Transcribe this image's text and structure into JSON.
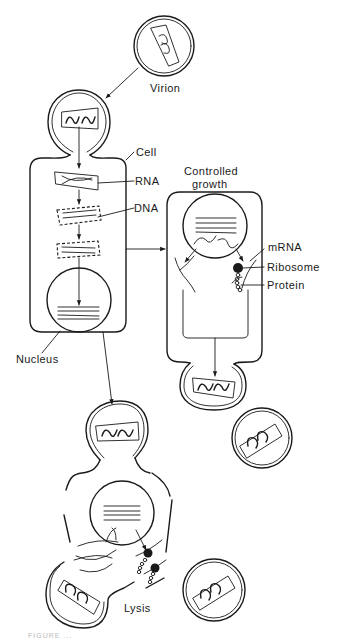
{
  "figure": {
    "labels": {
      "virion": "Virion",
      "cell": "Cell",
      "rna": "RNA",
      "dna": "DNA",
      "nucleus": "Nucleus",
      "controlled_growth_line1": "Controlled",
      "controlled_growth_line2": "growth",
      "mrna": "mRNA",
      "ribosome": "Ribosome",
      "protein": "Protein",
      "lysis": "Lysis"
    },
    "stages": [
      "Virion attaches to cell",
      "RNA released",
      "RNA reverse-transcribed to DNA",
      "DNA enters nucleus",
      "Controlled growth: mRNA translated by ribosomes into protein; virions bud off",
      "Lysis: cell ruptures releasing virions"
    ],
    "colors": {
      "ink": "#1a1a1a",
      "background": "#ffffff"
    },
    "caption_partial": "FIGURE ..."
  }
}
